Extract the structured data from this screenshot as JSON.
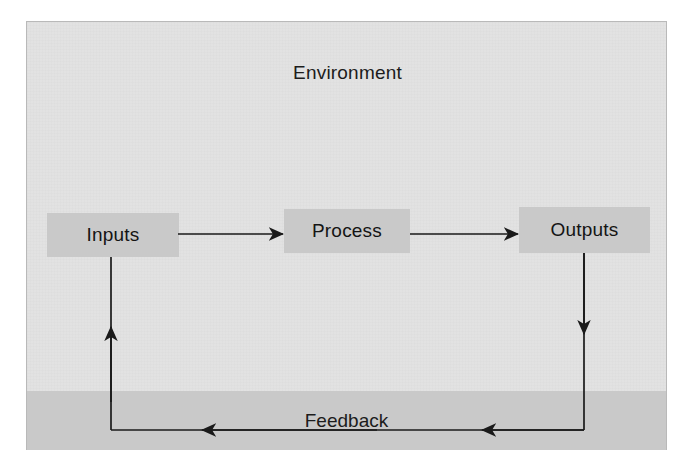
{
  "diagram": {
    "type": "system-model-flow-diagram",
    "title": "Environment",
    "feedback_label": "Feedback",
    "nodes": [
      {
        "id": "inputs",
        "label": "Inputs"
      },
      {
        "id": "process",
        "label": "Process"
      },
      {
        "id": "outputs",
        "label": "Outputs"
      }
    ],
    "flows": [
      {
        "id": "inputs-to-process",
        "from": "Inputs",
        "to": "Process",
        "direction": "right"
      },
      {
        "id": "process-to-outputs",
        "from": "Process",
        "to": "Outputs",
        "direction": "right"
      },
      {
        "id": "outputs-to-feedback",
        "from": "Outputs",
        "to": "Feedback",
        "direction": "down"
      },
      {
        "id": "feedback-return",
        "from": "Feedback",
        "to": "Feedback",
        "direction": "left"
      },
      {
        "id": "feedback-to-inputs",
        "from": "Feedback",
        "to": "Inputs",
        "direction": "up"
      }
    ],
    "colors": {
      "environment_fill": "#e2e2e2",
      "node_fill": "#c9c9c9",
      "band_fill": "#c9c9c9",
      "line": "#1a1a1a",
      "text": "#141414",
      "frame_border": "#b9b9b9",
      "page_background": "#ffffff"
    }
  }
}
